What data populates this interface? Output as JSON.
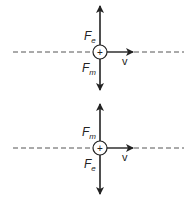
{
  "diagrams": [
    {
      "id": "top",
      "charge_symbol": "+",
      "velocity_label": "v",
      "up_force": {
        "main": "F",
        "sub": "e"
      },
      "down_force": {
        "main": "F",
        "sub": "m"
      }
    },
    {
      "id": "bottom",
      "charge_symbol": "+",
      "velocity_label": "v",
      "up_force": {
        "main": "F",
        "sub": "m"
      },
      "down_force": {
        "main": "F",
        "sub": "e"
      }
    }
  ],
  "colors": {
    "stroke": "#222222",
    "dash": "#555555",
    "background": "#ffffff"
  }
}
